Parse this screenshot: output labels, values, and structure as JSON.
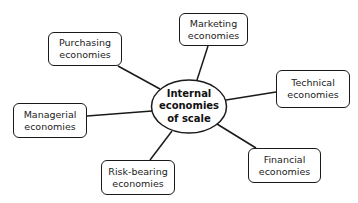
{
  "diagram": {
    "type": "spider-diagram",
    "center": {
      "line1": "Internal",
      "line2": "economies",
      "line3": "of scale"
    },
    "nodes": [
      {
        "id": "purchasing",
        "line1": "Purchasing",
        "line2": "economies"
      },
      {
        "id": "marketing",
        "line1": "Marketing",
        "line2": "economies"
      },
      {
        "id": "technical",
        "line1": "Technical",
        "line2": "economies"
      },
      {
        "id": "managerial",
        "line1": "Managerial",
        "line2": "economies"
      },
      {
        "id": "risk-bearing",
        "line1": "Risk-bearing",
        "line2": "economies"
      },
      {
        "id": "financial",
        "line1": "Financial",
        "line2": "economies"
      }
    ],
    "colors": {
      "stroke": "#1a1a1a",
      "background": "#ffffff",
      "text": "#222222"
    }
  }
}
